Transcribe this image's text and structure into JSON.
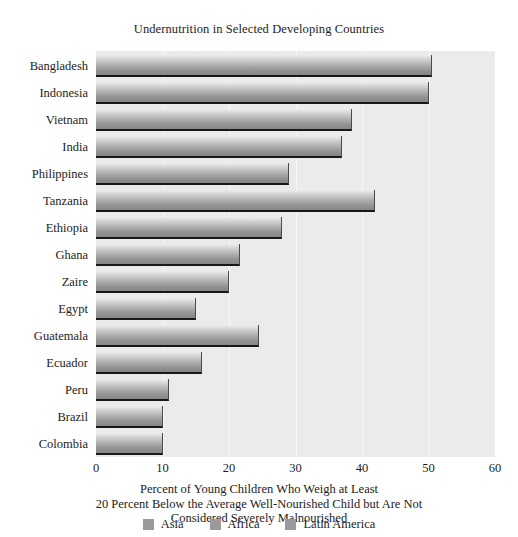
{
  "chart_data": {
    "type": "bar",
    "orientation": "horizontal",
    "title": "Undernutrition in Selected Developing Countries",
    "categories": [
      "Bangladesh",
      "Indonesia",
      "Vietnam",
      "India",
      "Philippines",
      "Tanzania",
      "Ethiopia",
      "Ghana",
      "Zaire",
      "Egypt",
      "Guatemala",
      "Ecuador",
      "Peru",
      "Brazil",
      "Colombia"
    ],
    "values": [
      50.5,
      50,
      38.5,
      37,
      29,
      42,
      28,
      21.7,
      20,
      15,
      24.5,
      16,
      11,
      10,
      10
    ],
    "groups": [
      "Asia",
      "Asia",
      "Asia",
      "Asia",
      "Asia",
      "Africa",
      "Africa",
      "Africa",
      "Africa",
      "Africa",
      "Latin America",
      "Latin America",
      "Latin America",
      "Latin America",
      "Latin America"
    ],
    "xlabel": "Percent of Young Children Who Weigh at Least 20 Percent Below the Average Well-Nourished Child but Are Not Considered Severely Malnourished",
    "xlabel_lines": [
      "Percent of Young Children Who Weigh at Least",
      "20 Percent Below the Average Well-Nourished Child but Are Not",
      "Considered Severely Malnourished"
    ],
    "ylabel": "",
    "xlim": [
      0,
      60
    ],
    "xticks": [
      0,
      10,
      20,
      30,
      40,
      50,
      60
    ],
    "xtick_labels": [
      "0",
      "10",
      "20",
      "30",
      "40",
      "50",
      "60"
    ],
    "grid": true,
    "legend_position": "bottom",
    "legend": [
      {
        "label": "Asia",
        "color": "#9a9a9a"
      },
      {
        "label": "Africa",
        "color": "#9a9a9a"
      },
      {
        "label": "Latin America",
        "color": "#9a9a9a"
      }
    ],
    "colors": {
      "plot_background": "#ebebeb",
      "gridline": "#f7f7f7",
      "bar_light": "#ededed",
      "bar_dark": "#868686",
      "bar_edge": "#17181a",
      "text": "#1c1c1c"
    }
  }
}
